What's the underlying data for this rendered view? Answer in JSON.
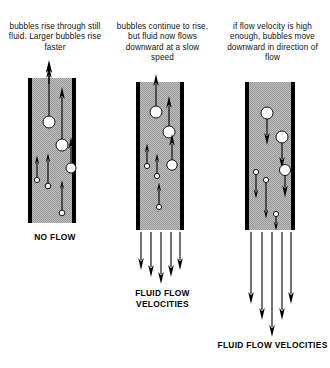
{
  "diagram": {
    "colors": {
      "fluid_fill": "#b3b3b3",
      "tube_wall": "#000000",
      "bubble_fill": "#ffffff",
      "bubble_stroke": "#000000",
      "arrow": "#000000",
      "text": "#111111"
    }
  },
  "panels": [
    {
      "id": "no-flow",
      "caption": "bubbles rise through still fluid. Larger bubbles rise faster",
      "label": "NO FLOW",
      "tube": {
        "x": 28,
        "y": 78,
        "width": 48,
        "height": 145,
        "wall_thickness": 4
      },
      "bubble_direction": "up",
      "flow_direction": "none",
      "bubbles": [
        {
          "cx": 49,
          "cy": 122,
          "r": 6.0,
          "arrow_length": 50,
          "size": "large"
        },
        {
          "cx": 62,
          "cy": 145,
          "r": 6.0,
          "arrow_length": 52,
          "size": "large"
        },
        {
          "cx": 71,
          "cy": 168,
          "r": 5.0,
          "arrow_length": 26,
          "size": "medium"
        },
        {
          "cx": 37,
          "cy": 180,
          "r": 2.6,
          "arrow_length": 22,
          "size": "small"
        },
        {
          "cx": 48,
          "cy": 186,
          "r": 2.8,
          "arrow_length": 30,
          "size": "small"
        },
        {
          "cx": 62,
          "cy": 213,
          "r": 2.8,
          "arrow_length": 30,
          "size": "small"
        }
      ],
      "flow_arrows": []
    },
    {
      "id": "slow-flow",
      "caption": "bubbles continue to rise, but fluid now flows downward at a slow speed",
      "label": "FLUID FLOW VELOCITIES",
      "tube": {
        "x": 136,
        "y": 82,
        "width": 48,
        "height": 148,
        "wall_thickness": 4
      },
      "bubble_direction": "up",
      "flow_direction": "down",
      "bubbles": [
        {
          "cx": 156,
          "cy": 112,
          "r": 6.0,
          "arrow_length": 32,
          "size": "large"
        },
        {
          "cx": 169,
          "cy": 132,
          "r": 6.0,
          "arrow_length": 30,
          "size": "large"
        },
        {
          "cx": 172,
          "cy": 165,
          "r": 5.2,
          "arrow_length": 26,
          "size": "medium"
        },
        {
          "cx": 147,
          "cy": 166,
          "r": 2.6,
          "arrow_length": 20,
          "size": "small"
        },
        {
          "cx": 157,
          "cy": 176,
          "r": 2.6,
          "arrow_length": 20,
          "size": "small"
        },
        {
          "cx": 159,
          "cy": 207,
          "r": 2.6,
          "arrow_length": 22,
          "size": "small"
        }
      ],
      "flow_arrows": [
        {
          "x": 141,
          "length": 38
        },
        {
          "x": 151,
          "length": 45
        },
        {
          "x": 161,
          "length": 52
        },
        {
          "x": 171,
          "length": 45
        },
        {
          "x": 180,
          "length": 38
        }
      ],
      "flow_arrows_top": 232
    },
    {
      "id": "fast-flow",
      "caption": "if flow velocity is high enough, bubbles move downward in direction of flow",
      "label": "FLUID FLOW VELOCITIES",
      "tube": {
        "x": 245,
        "y": 82,
        "width": 50,
        "height": 148,
        "wall_thickness": 4
      },
      "bubble_direction": "down",
      "flow_direction": "down",
      "bubbles": [
        {
          "cx": 267,
          "cy": 113,
          "r": 6.0,
          "arrow_length": 26,
          "size": "large"
        },
        {
          "cx": 282,
          "cy": 137,
          "r": 6.0,
          "arrow_length": 26,
          "size": "large"
        },
        {
          "cx": 285,
          "cy": 170,
          "r": 5.5,
          "arrow_length": 22,
          "size": "medium"
        },
        {
          "cx": 256,
          "cy": 172,
          "r": 2.6,
          "arrow_length": 24,
          "size": "small"
        },
        {
          "cx": 266,
          "cy": 180,
          "r": 2.6,
          "arrow_length": 36,
          "size": "small"
        },
        {
          "cx": 276,
          "cy": 214,
          "r": 2.6,
          "arrow_length": 14,
          "size": "small"
        }
      ],
      "flow_arrows": [
        {
          "x": 251,
          "length": 72
        },
        {
          "x": 262,
          "length": 88
        },
        {
          "x": 272,
          "length": 105
        },
        {
          "x": 282,
          "length": 88
        },
        {
          "x": 291,
          "length": 72
        }
      ],
      "flow_arrows_top": 232
    }
  ]
}
